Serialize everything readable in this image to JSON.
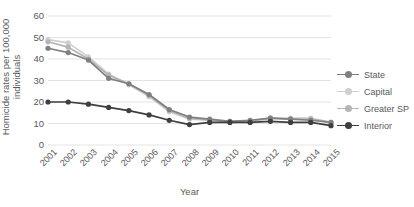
{
  "chart_data": {
    "type": "line",
    "title": "",
    "xlabel": "Year",
    "ylabel": "Homicide rates per 100,000\nindividuals",
    "ylim": [
      0,
      60
    ],
    "yticks": [
      0,
      10,
      20,
      30,
      40,
      50,
      60
    ],
    "grid": true,
    "legend_position": "right",
    "categories": [
      "2001",
      "2002",
      "2003",
      "2004",
      "2005",
      "2006",
      "2007",
      "2008",
      "2009",
      "2010",
      "2011",
      "2012",
      "2013",
      "2014",
      "2015"
    ],
    "series": [
      {
        "name": "State",
        "color": "#808080",
        "values": [
          45,
          43,
          39.5,
          31,
          28.5,
          23.5,
          16.5,
          13,
          12,
          11,
          11.5,
          12.5,
          12,
          11.5,
          10.5
        ]
      },
      {
        "name": "Capital",
        "color": "#cfcfcf",
        "values": [
          49,
          47.5,
          41,
          33,
          28,
          22.5,
          15.5,
          12,
          11.5,
          11,
          11,
          12.5,
          12.5,
          12.5,
          10.5
        ]
      },
      {
        "name": "Greater SP",
        "color": "#b5b5b5",
        "values": [
          48,
          45.5,
          40,
          32.5,
          28.5,
          23,
          16,
          12.5,
          11.5,
          11,
          11,
          12.5,
          12,
          12,
          10.5
        ]
      },
      {
        "name": "Interior",
        "color": "#3f3f3f",
        "values": [
          20,
          20,
          19,
          17.5,
          16,
          14,
          11.5,
          9.5,
          10.5,
          10.5,
          10.5,
          11,
          10.5,
          10.5,
          9
        ]
      }
    ]
  },
  "legend": {
    "items": [
      {
        "label": "State"
      },
      {
        "label": "Capital"
      },
      {
        "label": "Greater SP"
      },
      {
        "label": "Interior"
      }
    ]
  },
  "colors": {
    "gridline": "#e3e3e3",
    "text": "#595959",
    "background": "#ffffff"
  }
}
